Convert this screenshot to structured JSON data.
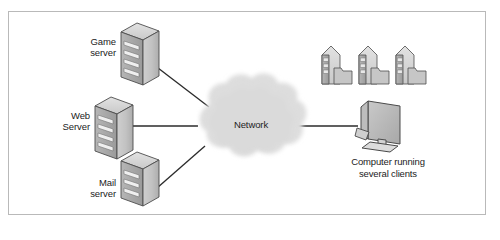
{
  "figure": {
    "kind": "network-diagram",
    "border_color": "#b9b9b9",
    "background": "#ffffff"
  },
  "nodes": {
    "game_server": {
      "label": "Game\nserver",
      "icon": "server-tower-icon"
    },
    "web_server": {
      "label": "Web\nServer",
      "icon": "server-tower-icon"
    },
    "mail_server": {
      "label": "Mail\nserver",
      "icon": "server-tower-icon"
    },
    "network_cloud": {
      "label": "Network",
      "icon": "cloud-icon",
      "fill": "#dcdcdc"
    },
    "client_computer": {
      "caption": "Computer running\nseveral clients",
      "icon": "desktop-computer-icon"
    },
    "client_instances": {
      "count": 3,
      "icon": "server-folder-icon",
      "items": [
        "client-instance-1",
        "client-instance-2",
        "client-instance-3"
      ]
    }
  },
  "links": [
    {
      "name": "game-server-to-network",
      "from": "game_server",
      "to": "network_cloud"
    },
    {
      "name": "web-server-to-network",
      "from": "web_server",
      "to": "network_cloud"
    },
    {
      "name": "mail-server-to-network",
      "from": "mail_server",
      "to": "network_cloud"
    },
    {
      "name": "network-to-client-computer",
      "from": "network_cloud",
      "to": "client_computer"
    }
  ],
  "colors": {
    "line": "#2b2b2b",
    "server_front": "#bdbdbd",
    "server_side": "#9e9e9e",
    "server_top": "#d8d8d8",
    "cloud": "#dcdcdc",
    "text": "#1b1b1b"
  }
}
